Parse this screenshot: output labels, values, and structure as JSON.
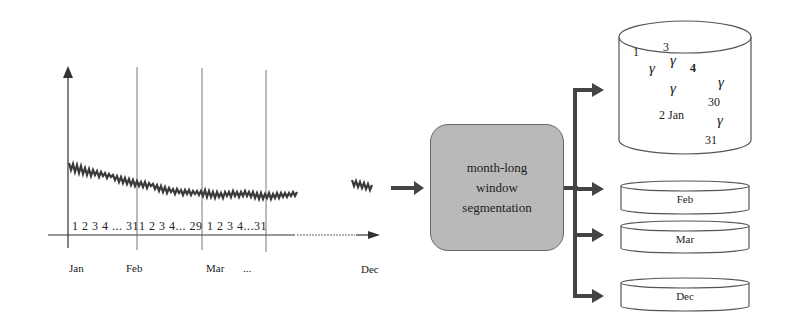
{
  "timeline": {
    "months": [
      "Jan",
      "Feb",
      "Mar",
      "...",
      "Dec"
    ],
    "day_ranges": [
      {
        "month": "Jan",
        "label": "1 2 3 4 ... 31"
      },
      {
        "month": "Feb",
        "label": "1 2 3 4... 29"
      },
      {
        "month": "Mar",
        "label": "1 2 3 4...31"
      }
    ],
    "ellipsis": "..."
  },
  "process_box": {
    "line1": "month-long",
    "line2": "window",
    "line3": "segmentation"
  },
  "storage": {
    "main_cylinder": {
      "labels": [
        "1",
        "3",
        "4",
        "2 Jan",
        "30",
        "31"
      ],
      "glyph": "γ"
    },
    "segments": [
      {
        "label": "Feb"
      },
      {
        "label": "Mar"
      },
      {
        "label": "Dec"
      }
    ]
  },
  "colors": {
    "stroke": "#444444",
    "box_fill": "#b9b9b9",
    "signal": "#3a3a3a"
  }
}
